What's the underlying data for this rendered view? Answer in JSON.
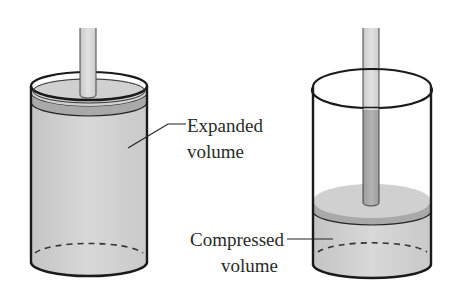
{
  "figure": {
    "colors": {
      "background": "#ffffff",
      "gas_fill": "#d4d4d4",
      "gas_fill_dark": "#bdbdbd",
      "piston_top": "#cfcfcf",
      "piston_band": "#a9a9a9",
      "rod_fill": "#d9d9d9",
      "rod_inner": "#a8a8a8",
      "outline": "#1a1a1a",
      "label_text": "#2a2a2a"
    },
    "left_cylinder": {
      "name": "expanded",
      "label_line1": "Expanded",
      "label_line2": "volume"
    },
    "right_cylinder": {
      "name": "compressed",
      "label_line1": "Compressed",
      "label_line2": "volume"
    }
  }
}
